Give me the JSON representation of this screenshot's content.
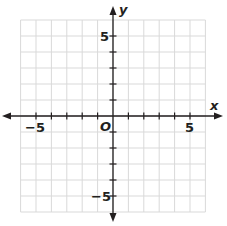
{
  "graph": {
    "x_axis_label": "x",
    "y_axis_label": "y",
    "origin_label": "O",
    "x_min": -6,
    "x_max": 6,
    "y_min": -6,
    "y_max": 6,
    "tick_labels": {
      "x_neg": "−5",
      "x_pos": "5",
      "y_pos": "5",
      "y_neg": "−5"
    },
    "colors": {
      "grid": "#d9d9d9",
      "axis": "#231f20",
      "background": "#ffffff"
    }
  }
}
